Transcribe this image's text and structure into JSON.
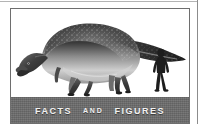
{
  "figure": {
    "name": "dinosaur-scale-illustration",
    "caption_words": [
      {
        "text": "Facts",
        "size": "large"
      },
      {
        "text": "and",
        "size": "small"
      },
      {
        "text": "Figures",
        "size": "large"
      }
    ],
    "caption_full": "FACTS AND FIGURES",
    "subjects": {
      "dinosaur_label": "hadrosaur-dinosaur-silhouette",
      "human_label": "human-scale-silhouette"
    }
  },
  "colors": {
    "banner_bg": "#6b6b6b",
    "banner_text": "#f2f2f2",
    "frame_border": "#6e6e6e",
    "page_bg": "#ffffff",
    "dino_dark": "#2e2e2e",
    "dino_mid": "#6a6a6a",
    "dino_light": "#c8c8c8",
    "human_silhouette": "#1d1d1d",
    "outer_rule": "#8c8c8c"
  }
}
